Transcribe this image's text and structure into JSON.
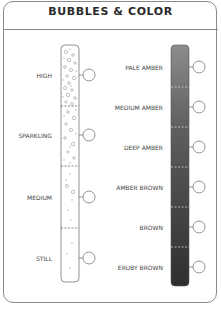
{
  "title": "BUBBLES & COLOR",
  "bubbles": {
    "levels": [
      {
        "label": "HIGH",
        "y": 75
      },
      {
        "label": "SPARKLING",
        "y": 135
      },
      {
        "label": "MEDIUM",
        "y": 197
      },
      {
        "label": "STILL",
        "y": 258
      }
    ]
  },
  "color": {
    "gradient_top": "#8c8c8c",
    "gradient_bottom": "#2e2e2e",
    "levels": [
      {
        "label": "PALE AMBER",
        "y": 67
      },
      {
        "label": "MEDIUM AMBER",
        "y": 107
      },
      {
        "label": "DEEP AMBER",
        "y": 147
      },
      {
        "label": "AMBER BROWN",
        "y": 187
      },
      {
        "label": "BROWN",
        "y": 227
      },
      {
        "label": "ERUBY BROWN",
        "y": 267
      }
    ]
  }
}
